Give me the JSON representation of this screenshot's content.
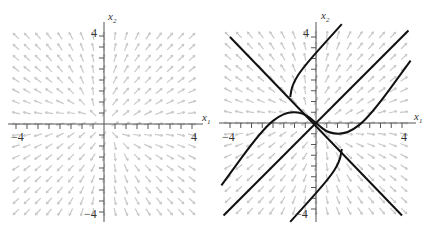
{
  "chart_data": [
    {
      "type": "direction-field",
      "title": "",
      "xlabel": "x1",
      "ylabel": "x2",
      "xlim": [
        -4.2,
        4.2
      ],
      "ylim": [
        -4.2,
        4.2
      ],
      "tick_step": 0.5,
      "tick_labels": {
        "x": [
          "-4",
          "4"
        ],
        "y": [
          "4",
          "-4"
        ]
      },
      "field_color": "#c8c8c8",
      "trajectories": []
    },
    {
      "type": "direction-field",
      "title": "",
      "xlabel": "x1",
      "ylabel": "x2",
      "xlim": [
        -4.2,
        4.2
      ],
      "ylim": [
        -4.2,
        4.2
      ],
      "tick_step": 0.5,
      "tick_labels": {
        "x": [
          "-4",
          "4"
        ],
        "y": [
          "4",
          "-4"
        ]
      },
      "field_color": "#c8c8c8",
      "trajectories": [
        {
          "name": "line y=-x",
          "points": [
            [
              -4,
              4
            ],
            [
              4,
              -4.3
            ]
          ]
        },
        {
          "name": "line y=x",
          "points": [
            [
              -4.3,
              -4.3
            ],
            [
              4.3,
              4.3
            ]
          ]
        },
        {
          "name": "curve upper",
          "points": [
            [
              -1.2,
              1.2
            ],
            [
              -1.1,
              1.8
            ],
            [
              -0.6,
              2.6
            ],
            [
              1.2,
              4.6
            ]
          ]
        },
        {
          "name": "curve left",
          "points": [
            [
              -4.4,
              -2.9
            ],
            [
              -2.5,
              -0.3
            ],
            [
              -1.5,
              0.5
            ],
            [
              -0.6,
              0.5
            ],
            [
              0,
              0
            ]
          ]
        },
        {
          "name": "curve right",
          "points": [
            [
              0,
              0
            ],
            [
              0.6,
              -0.5
            ],
            [
              1.5,
              -0.5
            ],
            [
              2.5,
              0.3
            ],
            [
              4.4,
              2.9
            ]
          ]
        },
        {
          "name": "curve lower",
          "points": [
            [
              1.2,
              -1.2
            ],
            [
              1.1,
              -1.8
            ],
            [
              0.6,
              -2.6
            ],
            [
              -1.2,
              -4.6
            ]
          ]
        }
      ]
    }
  ],
  "labels": {
    "x_axis": "x",
    "x_sub": "1",
    "y_axis": "x",
    "y_sub": "2",
    "neg4": "−4",
    "pos4": "4"
  }
}
